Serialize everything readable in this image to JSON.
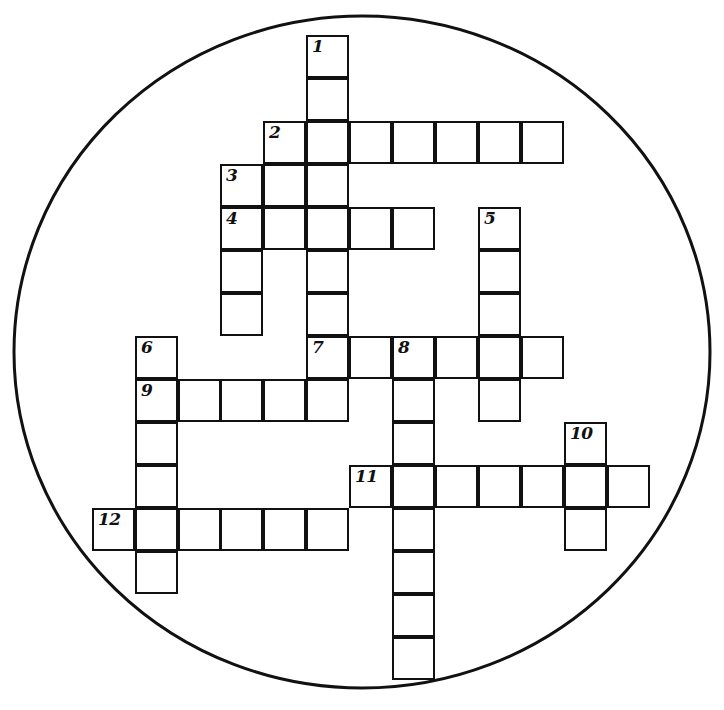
{
  "puzzle": {
    "title": "Crossword Puzzle",
    "shape": "circle",
    "cell_size": 43,
    "origin_x": 92,
    "origin_y": 35,
    "ink_color": "#111111",
    "paper_color": "#ffffff",
    "circle": {
      "center_x": 362,
      "center_y": 352,
      "radius_x": 348,
      "radius_y": 336,
      "stroke_width": 3
    },
    "grid_columns": [
      92,
      135,
      178,
      220,
      263,
      306,
      349,
      392,
      435,
      478,
      521,
      564,
      607,
      650
    ],
    "grid_rows": [
      35,
      78,
      121,
      164,
      207,
      250,
      293,
      336,
      379,
      422,
      465,
      508,
      551,
      594,
      637,
      680
    ],
    "clue_numbers": [
      "1",
      "2",
      "3",
      "4",
      "5",
      "6",
      "7",
      "8",
      "9",
      "10",
      "11",
      "12"
    ],
    "entries": [
      {
        "number": "1",
        "direction": "down",
        "col": 5,
        "row": 0,
        "length": 8,
        "label_col": 5,
        "label_row": 0
      },
      {
        "number": "2",
        "direction": "across",
        "col": 4,
        "row": 2,
        "length": 7,
        "label_col": 4,
        "label_row": 2
      },
      {
        "number": "3",
        "direction": "down",
        "col": 3,
        "row": 3,
        "length": 4,
        "label_col": 3,
        "label_row": 3
      },
      {
        "number": "4",
        "direction": "across",
        "col": 3,
        "row": 4,
        "length": 5,
        "label_col": 3,
        "label_row": 4
      },
      {
        "number": "5",
        "direction": "down",
        "col": 9,
        "row": 4,
        "length": 5,
        "label_col": 9,
        "label_row": 4
      },
      {
        "number": "6",
        "direction": "down",
        "col": 1,
        "row": 7,
        "length": 6,
        "label_col": 1,
        "label_row": 7
      },
      {
        "number": "7",
        "direction": "across",
        "col": 5,
        "row": 7,
        "length": 6,
        "label_col": 5,
        "label_row": 7
      },
      {
        "number": "8",
        "direction": "down",
        "col": 7,
        "row": 7,
        "length": 8,
        "label_col": 7,
        "label_row": 7
      },
      {
        "number": "9",
        "direction": "across",
        "col": 1,
        "row": 8,
        "length": 5,
        "label_col": 1,
        "label_row": 8
      },
      {
        "number": "10",
        "direction": "down",
        "col": 11,
        "row": 9,
        "length": 3,
        "label_col": 11,
        "label_row": 9
      },
      {
        "number": "11",
        "direction": "across",
        "col": 6,
        "row": 10,
        "length": 7,
        "label_col": 6,
        "label_row": 10
      },
      {
        "number": "12",
        "direction": "across",
        "col": 0,
        "row": 11,
        "length": 6,
        "label_col": 0,
        "label_row": 11
      }
    ],
    "cells": [
      {
        "col": 5,
        "row": 0,
        "number": "1"
      },
      {
        "col": 5,
        "row": 1
      },
      {
        "col": 4,
        "row": 2,
        "number": "2"
      },
      {
        "col": 5,
        "row": 2
      },
      {
        "col": 6,
        "row": 2
      },
      {
        "col": 7,
        "row": 2
      },
      {
        "col": 8,
        "row": 2
      },
      {
        "col": 9,
        "row": 2
      },
      {
        "col": 10,
        "row": 2
      },
      {
        "col": 3,
        "row": 3,
        "number": "3"
      },
      {
        "col": 4,
        "row": 3
      },
      {
        "col": 5,
        "row": 3
      },
      {
        "col": 3,
        "row": 4,
        "number": "4"
      },
      {
        "col": 4,
        "row": 4
      },
      {
        "col": 5,
        "row": 4
      },
      {
        "col": 6,
        "row": 4
      },
      {
        "col": 7,
        "row": 4
      },
      {
        "col": 9,
        "row": 4,
        "number": "5"
      },
      {
        "col": 3,
        "row": 5
      },
      {
        "col": 5,
        "row": 5
      },
      {
        "col": 9,
        "row": 5
      },
      {
        "col": 3,
        "row": 6
      },
      {
        "col": 5,
        "row": 6
      },
      {
        "col": 9,
        "row": 6
      },
      {
        "col": 1,
        "row": 7,
        "number": "6"
      },
      {
        "col": 5,
        "row": 7,
        "number": "7"
      },
      {
        "col": 6,
        "row": 7
      },
      {
        "col": 7,
        "row": 7,
        "number": "8"
      },
      {
        "col": 8,
        "row": 7
      },
      {
        "col": 9,
        "row": 7
      },
      {
        "col": 10,
        "row": 7
      },
      {
        "col": 1,
        "row": 8,
        "number": "9"
      },
      {
        "col": 2,
        "row": 8
      },
      {
        "col": 3,
        "row": 8
      },
      {
        "col": 4,
        "row": 8
      },
      {
        "col": 5,
        "row": 8
      },
      {
        "col": 7,
        "row": 8
      },
      {
        "col": 9,
        "row": 8
      },
      {
        "col": 1,
        "row": 9
      },
      {
        "col": 7,
        "row": 9
      },
      {
        "col": 11,
        "row": 9,
        "number": "10"
      },
      {
        "col": 1,
        "row": 10
      },
      {
        "col": 6,
        "row": 10,
        "number": "11"
      },
      {
        "col": 7,
        "row": 10
      },
      {
        "col": 8,
        "row": 10
      },
      {
        "col": 9,
        "row": 10
      },
      {
        "col": 10,
        "row": 10
      },
      {
        "col": 11,
        "row": 10
      },
      {
        "col": 12,
        "row": 10
      },
      {
        "col": 0,
        "row": 11,
        "number": "12"
      },
      {
        "col": 1,
        "row": 11
      },
      {
        "col": 2,
        "row": 11
      },
      {
        "col": 3,
        "row": 11
      },
      {
        "col": 4,
        "row": 11
      },
      {
        "col": 5,
        "row": 11
      },
      {
        "col": 7,
        "row": 11
      },
      {
        "col": 11,
        "row": 11
      },
      {
        "col": 1,
        "row": 12
      },
      {
        "col": 7,
        "row": 12
      },
      {
        "col": 7,
        "row": 13
      },
      {
        "col": 7,
        "row": 14
      }
    ]
  }
}
